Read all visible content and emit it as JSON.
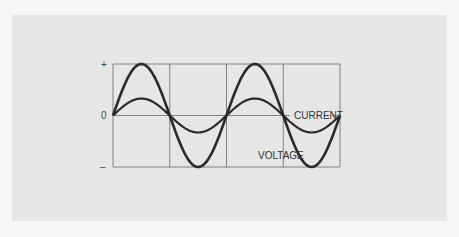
{
  "chart_data": {
    "type": "line",
    "title": "",
    "y_tick_labels": [
      "+",
      "0",
      "–"
    ],
    "x_cycles": 2,
    "x_divisions": 4,
    "series": [
      {
        "name": "VOLTAGE",
        "amplitude": 1.0,
        "phase_deg": 0
      },
      {
        "name": "CURRENT",
        "amplitude": 0.33,
        "phase_deg": 0
      }
    ],
    "ylim": [
      -1,
      1
    ],
    "grid": true,
    "annotations": [
      "CURRENT",
      "VOLTAGE"
    ]
  },
  "colors": {
    "curve": "#2a2a2a",
    "grid": "#777777"
  }
}
